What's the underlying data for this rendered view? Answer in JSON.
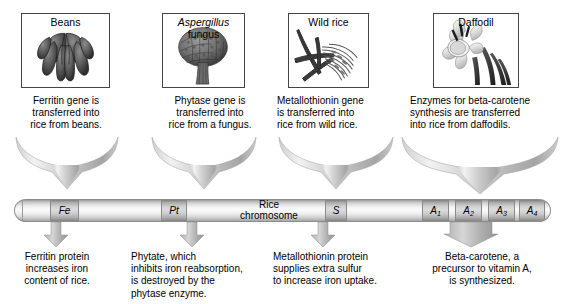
{
  "diagram": {
    "chromosome_label_line1": "Rice",
    "chromosome_label_line2": "chromosome"
  },
  "sources": [
    {
      "id": "beans",
      "caption": "Beans",
      "caption_italic_part": "",
      "artwork": "bean-pods-illustration"
    },
    {
      "id": "aspergillus",
      "caption_italic_part": "Aspergillus",
      "caption": " fungus",
      "artwork": "aspergillus-conidiophore-illustration"
    },
    {
      "id": "wild-rice",
      "caption": "Wild rice",
      "caption_italic_part": "",
      "artwork": "wild-rice-grass-illustration"
    },
    {
      "id": "daffodil",
      "caption": "Daffodil",
      "caption_italic_part": "",
      "artwork": "daffodil-flower-illustration"
    }
  ],
  "transfer_texts": [
    "Ferritin gene is\ntransferred into\nrice from beans.",
    "Phytase gene is\ntransferred into\nrice from a fungus.",
    "Metallothionin gene\nis transferred into\nrice from wild rice.",
    "Enzymes for beta-carotene\nsynthesis are transferred\ninto rice from daffodils."
  ],
  "genes": [
    {
      "label": "Fe",
      "subscript": ""
    },
    {
      "label": "Pt",
      "subscript": ""
    },
    {
      "label": "S",
      "subscript": ""
    },
    {
      "label": "A",
      "subscript": "1"
    },
    {
      "label": "A",
      "subscript": "2"
    },
    {
      "label": "A",
      "subscript": "3"
    },
    {
      "label": "A",
      "subscript": "4"
    }
  ],
  "result_texts": [
    "Ferritin protein\nincreases iron\ncontent of rice.",
    "Phytate, which\ninhibits iron reabsorption,\nis destroyed by the\nphytase enzyme.",
    "Metallothionin protein\nsupplies extra sulfur\nto increase iron uptake.",
    "Beta-carotene, a\nprecursor to vitamin A,\nis synthesized."
  ],
  "icons": {
    "funnel_arrow": "funnel-down-arrow-icon",
    "down_arrow": "down-arrow-icon"
  },
  "colors": {
    "background": "#ffffff",
    "text": "#000000",
    "box_border": "#444444",
    "arrow_fill": "#b9b9b9",
    "chromosome_light": "#fbfbfb",
    "chromosome_dark": "#9a9a9a",
    "band_fill": "#b5b5b5"
  }
}
